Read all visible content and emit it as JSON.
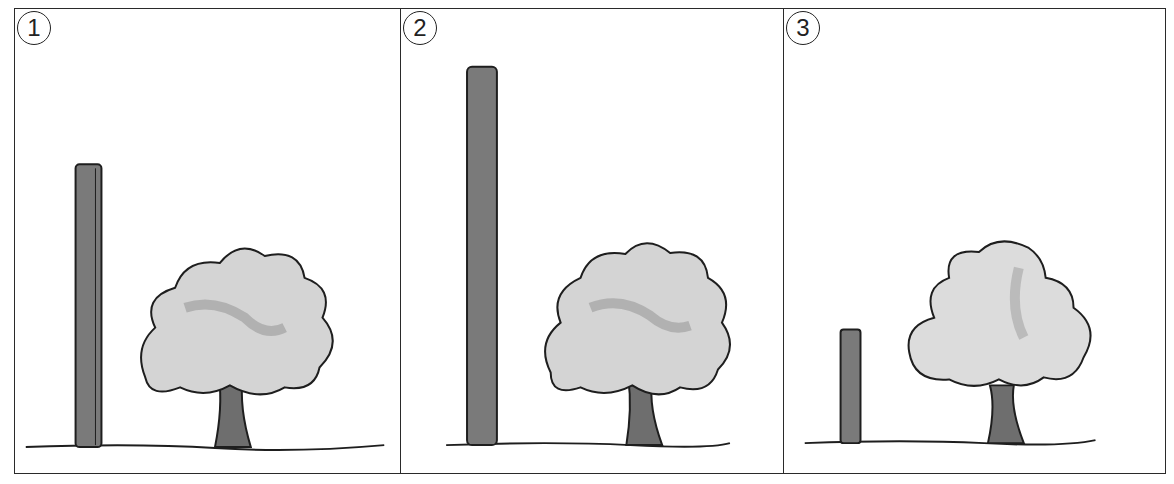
{
  "figure": {
    "panels": [
      {
        "label": "1",
        "pole": {
          "x": 60,
          "top": 156,
          "height": 284
        },
        "tree": {
          "cx": 210,
          "crown_top": 238
        }
      },
      {
        "label": "2",
        "pole": {
          "x": 66,
          "top": 58,
          "height": 380
        },
        "tree": {
          "cx": 240,
          "crown_top": 232
        }
      },
      {
        "label": "3",
        "pole": {
          "x": 56,
          "top": 322,
          "height": 114
        },
        "tree": {
          "cx": 222,
          "crown_top": 232
        }
      }
    ],
    "colors": {
      "pole": "#7a7a7a",
      "outline": "#1e1e1e",
      "foliage": "#c8c8c8",
      "foliage_dark": "#9a9a9a",
      "trunk": "#6e6e6e"
    }
  }
}
